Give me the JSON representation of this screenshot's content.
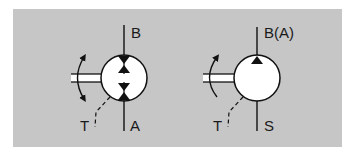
{
  "diagram": {
    "type": "hydraulic-schematic",
    "background_color": "#c6c6c6",
    "symbols": [
      {
        "name": "bidirectional-pump-motor",
        "description": "Hydraulic pump/motor, two flow directions, bidirectional rotation, case drain",
        "labels": {
          "top_port": "B",
          "bottom_port": "A",
          "drain_port": "T"
        },
        "rotation": "bidirectional",
        "flow_arrows": 4
      },
      {
        "name": "unidirectional-pump",
        "description": "Hydraulic pump, one flow direction, single rotation direction, case drain",
        "labels": {
          "top_port": "B(A)",
          "bottom_port": "S",
          "drain_port": "T"
        },
        "rotation": "unidirectional",
        "flow_arrows": 1
      }
    ]
  }
}
